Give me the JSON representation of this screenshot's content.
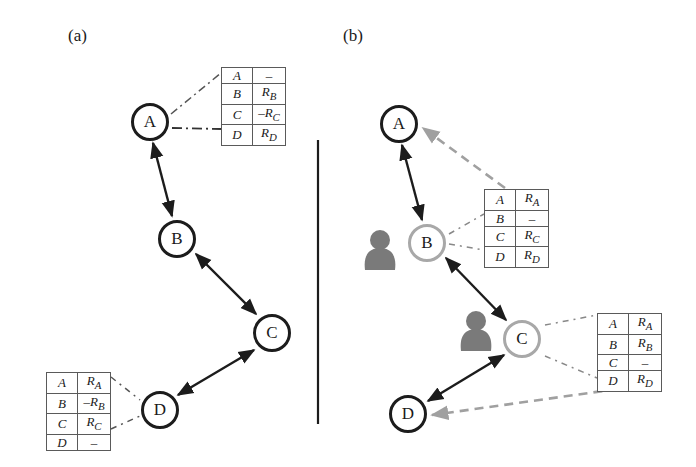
{
  "panels": {
    "a": {
      "label": "(a)",
      "nodes": {
        "A": "A",
        "B": "B",
        "C": "C",
        "D": "D"
      },
      "tables": {
        "A": {
          "rows": [
            {
              "dest": "A",
              "value": "–"
            },
            {
              "dest": "B",
              "value": "R_B"
            },
            {
              "dest": "C",
              "value": "–R_C"
            },
            {
              "dest": "D",
              "value": "R_D"
            }
          ]
        },
        "D": {
          "rows": [
            {
              "dest": "A",
              "value": "R_A"
            },
            {
              "dest": "B",
              "value": "–R_B"
            },
            {
              "dest": "C",
              "value": "R_C"
            },
            {
              "dest": "D",
              "value": "–"
            }
          ]
        }
      },
      "links": [
        [
          "A",
          "B"
        ],
        [
          "B",
          "C"
        ],
        [
          "C",
          "D"
        ]
      ]
    },
    "b": {
      "label": "(b)",
      "nodes": {
        "A": "A",
        "B": "B",
        "C": "C",
        "D": "D"
      },
      "compromised_nodes": [
        "B",
        "C"
      ],
      "tables": {
        "B": {
          "rows": [
            {
              "dest": "A",
              "value": "R_A"
            },
            {
              "dest": "B",
              "value": "–"
            },
            {
              "dest": "C",
              "value": "R_C"
            },
            {
              "dest": "D",
              "value": "R_D"
            }
          ]
        },
        "C": {
          "rows": [
            {
              "dest": "A",
              "value": "R_A"
            },
            {
              "dest": "B",
              "value": "R_B"
            },
            {
              "dest": "C",
              "value": "–"
            },
            {
              "dest": "D",
              "value": "R_D"
            }
          ]
        }
      },
      "links": [
        [
          "A",
          "B"
        ],
        [
          "B",
          "C"
        ],
        [
          "C",
          "D"
        ]
      ],
      "forwarded_links": [
        [
          "B",
          "A"
        ],
        [
          "C",
          "D"
        ]
      ]
    }
  },
  "colors": {
    "dark_node": "#1c1c1c",
    "light_node": "#a8a8a8",
    "user_icon": "#7a7a7a",
    "dashed_arrow": "#a0a0a0"
  }
}
